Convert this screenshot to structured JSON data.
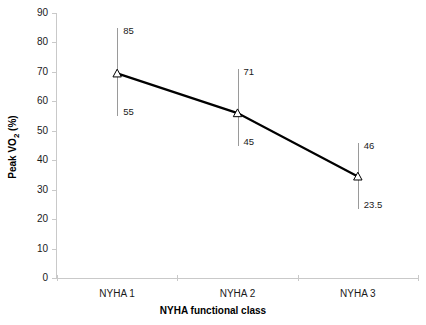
{
  "chart_data": {
    "type": "line",
    "title": "",
    "xlabel": "NYHA functional class",
    "ylabel": "Peak VO2 (%)",
    "ylabel_parts": {
      "prefix": "Peak VO",
      "sub": "2",
      "suffix": " (%)"
    },
    "categories": [
      "NYHA 1",
      "NYHA 2",
      "NYHA 3"
    ],
    "values": [
      69.5,
      56,
      34.5
    ],
    "error_upper": [
      85,
      71,
      46
    ],
    "error_lower": [
      55,
      45,
      23.5
    ],
    "error_upper_labels": [
      "85",
      "71",
      "46"
    ],
    "error_lower_labels": [
      "55",
      "45",
      "23.5"
    ],
    "ylim": [
      0,
      90
    ],
    "ytick_values": [
      0,
      10,
      20,
      30,
      40,
      50,
      60,
      70,
      80,
      90
    ],
    "ytick_labels": [
      "0",
      "10",
      "20",
      "30",
      "40",
      "50",
      "60",
      "70",
      "80",
      "90"
    ],
    "grid": false,
    "legend": false,
    "marker": "open-triangle",
    "line_color": "#000000",
    "errorbar_color": "#9a9a9a",
    "axis_color": "#c9c9c9"
  }
}
